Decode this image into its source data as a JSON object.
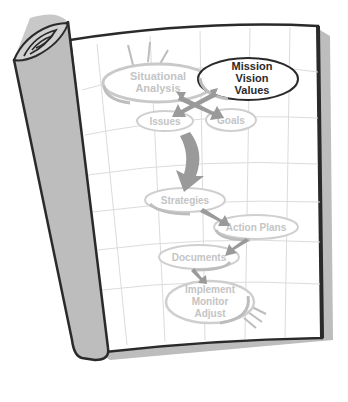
{
  "diagram": {
    "colors": {
      "page_bg": "#ffffff",
      "page_border": "#2a2a2a",
      "page_shadow": "#b8b8b8",
      "grid": "#dcdcdc",
      "roll_fill": "#bdbdbd",
      "faded_node_stroke": "#cfcfcf",
      "faded_node_text": "#c4c4c4",
      "highlight_node_stroke": "#2a2a2a",
      "highlight_node_text": "#2a2a2a",
      "arrow": "#9a9a9a"
    },
    "nodes": [
      {
        "id": "situational",
        "lines": [
          "Situational",
          "Analysis"
        ],
        "highlighted": false
      },
      {
        "id": "mission",
        "lines": [
          "Mission",
          "Vision",
          "Values"
        ],
        "highlighted": true
      },
      {
        "id": "issues",
        "lines": [
          "Issues"
        ],
        "highlighted": false
      },
      {
        "id": "goals",
        "lines": [
          "Goals"
        ],
        "highlighted": false
      },
      {
        "id": "strategies",
        "lines": [
          "Strategies"
        ],
        "highlighted": false
      },
      {
        "id": "action_plans",
        "lines": [
          "Action Plans"
        ],
        "highlighted": false
      },
      {
        "id": "documents",
        "lines": [
          "Documents"
        ],
        "highlighted": false
      },
      {
        "id": "implement",
        "lines": [
          "Implement",
          "Monitor",
          "Adjust"
        ],
        "highlighted": false
      }
    ],
    "edges": [
      {
        "from": "situational",
        "to": "goals"
      },
      {
        "from": "mission",
        "to": "issues"
      },
      {
        "from": "issues",
        "to": "strategies"
      },
      {
        "from": "strategies",
        "to": "action_plans"
      },
      {
        "from": "action_plans",
        "to": "documents"
      },
      {
        "from": "documents",
        "to": "implement"
      }
    ]
  }
}
